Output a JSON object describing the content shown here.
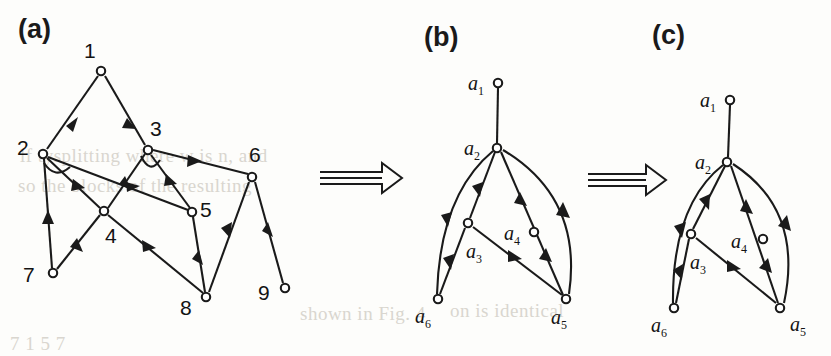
{
  "figure": {
    "background_color": "#fdfdfb",
    "ink_color": "#1a1a1a",
    "bleed_color": "#d9d6cf",
    "width": 831,
    "height": 356
  },
  "panels": [
    {
      "id": "a",
      "label": "(a)",
      "label_x": 18,
      "label_y": 22
    },
    {
      "id": "b",
      "label": "(b)",
      "label_x": 424,
      "label_y": 30
    },
    {
      "id": "c",
      "label": "(c)",
      "label_x": 652,
      "label_y": 28
    }
  ],
  "transform_arrows": [
    {
      "name": "arrow-a-to-b",
      "x": 318,
      "y": 166,
      "width": 84,
      "height": 30,
      "glyph": "double-right-arrow"
    },
    {
      "name": "arrow-b-to-c",
      "x": 586,
      "y": 168,
      "width": 80,
      "height": 30,
      "glyph": "double-right-arrow"
    }
  ],
  "graph_a": {
    "caption": "(a)",
    "nodes": [
      {
        "id": "1",
        "label": "1",
        "x": 101,
        "y": 71,
        "lx": 84,
        "ly": 39
      },
      {
        "id": "2",
        "label": "2",
        "x": 43,
        "y": 154,
        "lx": 17,
        "ly": 136
      },
      {
        "id": "3",
        "label": "3",
        "x": 148,
        "y": 150,
        "lx": 150,
        "ly": 117
      },
      {
        "id": "4",
        "label": "4",
        "x": 104,
        "y": 211,
        "lx": 105,
        "ly": 224
      },
      {
        "id": "5",
        "label": "5",
        "x": 192,
        "y": 212,
        "lx": 200,
        "ly": 198
      },
      {
        "id": "6",
        "label": "6",
        "x": 252,
        "y": 177,
        "lx": 249,
        "ly": 143
      },
      {
        "id": "7",
        "label": "7",
        "x": 53,
        "y": 273,
        "lx": 23,
        "ly": 263
      },
      {
        "id": "8",
        "label": "8",
        "x": 206,
        "y": 297,
        "lx": 180,
        "ly": 296
      },
      {
        "id": "9",
        "label": "9",
        "x": 285,
        "y": 288,
        "lx": 258,
        "ly": 281
      }
    ],
    "edges": [
      {
        "from": "1",
        "to": "2"
      },
      {
        "from": "1",
        "to": "3"
      },
      {
        "from": "2",
        "to": "7"
      },
      {
        "from": "2",
        "to": "4"
      },
      {
        "from": "2",
        "to": "5"
      },
      {
        "from": "3",
        "to": "4"
      },
      {
        "from": "3",
        "to": "5"
      },
      {
        "from": "3",
        "to": "6"
      },
      {
        "from": "4",
        "to": "7"
      },
      {
        "from": "4",
        "to": "8"
      },
      {
        "from": "5",
        "to": "8"
      },
      {
        "from": "6",
        "to": "8"
      },
      {
        "from": "6",
        "to": "9"
      }
    ]
  },
  "graph_b": {
    "caption": "(b)",
    "nodes": [
      {
        "id": "a1",
        "label": "a",
        "sub": "1",
        "x": 498,
        "y": 83,
        "lx": 468,
        "ly": 72
      },
      {
        "id": "a2",
        "label": "a",
        "sub": "2",
        "x": 497,
        "y": 148,
        "lx": 464,
        "ly": 137
      },
      {
        "id": "a3",
        "label": "a",
        "sub": "3",
        "x": 468,
        "y": 223,
        "lx": 466,
        "ly": 240
      },
      {
        "id": "a4",
        "label": "a",
        "sub": "4",
        "x": 534,
        "y": 232,
        "lx": 504,
        "ly": 222
      },
      {
        "id": "a5",
        "label": "a",
        "sub": "5",
        "x": 566,
        "y": 299,
        "lx": 551,
        "ly": 306
      },
      {
        "id": "a6",
        "label": "a",
        "sub": "6",
        "x": 438,
        "y": 299,
        "lx": 415,
        "ly": 305
      }
    ],
    "edges": [
      {
        "from": "a1",
        "to": "a2",
        "style": "straight",
        "arrow": false
      },
      {
        "from": "a2",
        "to": "a6",
        "style": "curve-left",
        "arrow": true
      },
      {
        "from": "a2",
        "to": "a3",
        "style": "straight",
        "arrow": true
      },
      {
        "from": "a3",
        "to": "a6",
        "style": "straight",
        "arrow": true
      },
      {
        "from": "a2",
        "to": "a5",
        "style": "through-a4",
        "arrow": true
      },
      {
        "from": "a2",
        "to": "a5",
        "style": "curve-right",
        "arrow": true
      },
      {
        "from": "a3",
        "to": "a5",
        "style": "straight",
        "arrow": true
      }
    ]
  },
  "graph_c": {
    "caption": "(c)",
    "nodes": [
      {
        "id": "a1",
        "label": "a",
        "sub": "1",
        "x": 730,
        "y": 100,
        "lx": 700,
        "ly": 89
      },
      {
        "id": "a2",
        "label": "a",
        "sub": "2",
        "x": 727,
        "y": 162,
        "lx": 695,
        "ly": 151
      },
      {
        "id": "a3",
        "label": "a",
        "sub": "3",
        "x": 691,
        "y": 234,
        "lx": 690,
        "ly": 251
      },
      {
        "id": "a4",
        "label": "a",
        "sub": "4",
        "x": 763,
        "y": 239,
        "lx": 731,
        "ly": 230
      },
      {
        "id": "a5",
        "label": "a",
        "sub": "5",
        "x": 780,
        "y": 308,
        "lx": 790,
        "ly": 313
      },
      {
        "id": "a6",
        "label": "a",
        "sub": "6",
        "x": 674,
        "y": 308,
        "lx": 651,
        "ly": 314
      }
    ],
    "edges": [
      {
        "from": "a1",
        "to": "a2",
        "style": "straight",
        "arrow": false
      },
      {
        "from": "a2",
        "to": "a6",
        "style": "curve-left",
        "arrow": true
      },
      {
        "from": "a2",
        "to": "a3",
        "style": "straight",
        "arrow": true
      },
      {
        "from": "a3",
        "to": "a6",
        "style": "straight",
        "arrow": true
      },
      {
        "from": "a2",
        "to": "a5",
        "style": "through-a4",
        "arrow": true
      },
      {
        "from": "a2",
        "to": "a5",
        "style": "curve-right",
        "arrow": true
      },
      {
        "from": "a3",
        "to": "a5",
        "style": "straight",
        "arrow": true
      }
    ]
  },
  "bleed_text": [
    {
      "text": "lf tysplitting where w is n, and",
      "x": 20,
      "y": 145
    },
    {
      "text": "so the blocks of the resulting",
      "x": 18,
      "y": 175
    },
    {
      "text": "shown in Fig. 4",
      "x": 300,
      "y": 303
    },
    {
      "text": "7 1 5 7",
      "x": 10,
      "y": 333
    },
    {
      "text": "on is identical",
      "x": 450,
      "y": 300
    }
  ]
}
